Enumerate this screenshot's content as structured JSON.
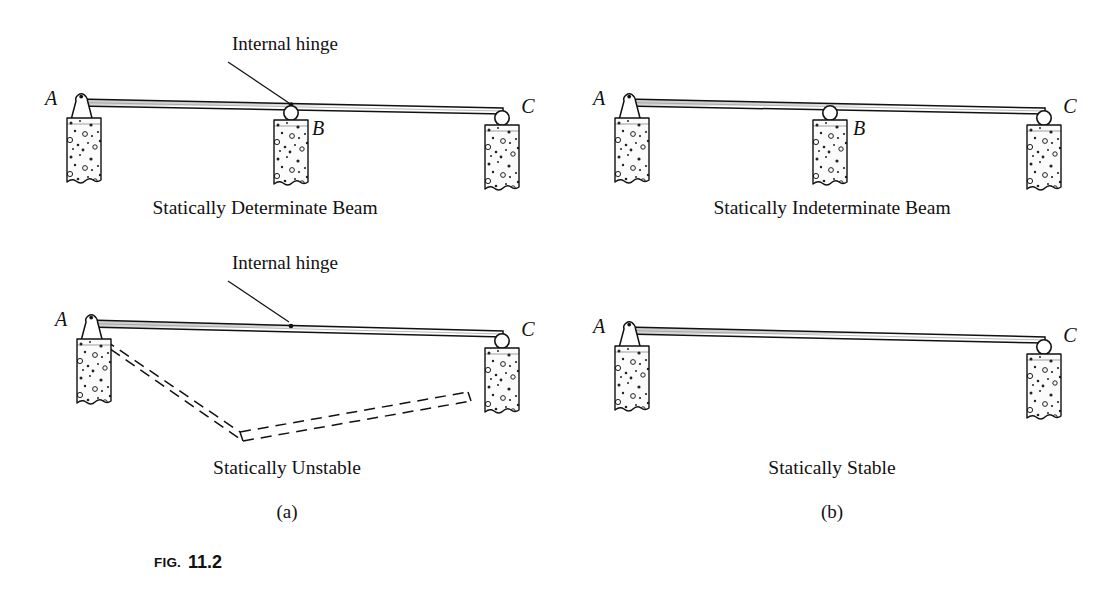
{
  "figure": {
    "number_prefix": "FIG.",
    "number_value": "11.2",
    "background_color": "#ffffff",
    "ink_color": "#111111",
    "beam_fill_color": "#d9d9d9",
    "block_fill_color": "#fbfbfb"
  },
  "annotations": {
    "internal_hinge": "Internal hinge"
  },
  "point_labels": {
    "a": "A",
    "b": "B",
    "c": "C"
  },
  "panels": [
    {
      "id": "statically-determinate",
      "caption": "Statically Determinate Beam",
      "column": "a",
      "row": "top",
      "has_internal_hinge": true,
      "hinge_label": "Internal hinge",
      "supports": [
        {
          "point": "A",
          "type": "pin"
        },
        {
          "point": "B",
          "type": "roller"
        },
        {
          "point": "C",
          "type": "roller"
        }
      ]
    },
    {
      "id": "statically-indeterminate",
      "caption": "Statically Indeterminate Beam",
      "column": "b",
      "row": "top",
      "has_internal_hinge": false,
      "hinge_label": "",
      "supports": [
        {
          "point": "A",
          "type": "pin"
        },
        {
          "point": "B",
          "type": "roller"
        },
        {
          "point": "C",
          "type": "roller"
        }
      ]
    },
    {
      "id": "statically-unstable",
      "caption": "Statically Unstable",
      "column": "a",
      "row": "bottom",
      "has_internal_hinge": true,
      "hinge_label": "Internal hinge",
      "has_collapse_mechanism": true,
      "supports": [
        {
          "point": "A",
          "type": "pin"
        },
        {
          "point": "C",
          "type": "roller"
        }
      ]
    },
    {
      "id": "statically-stable",
      "caption": "Statically Stable",
      "column": "b",
      "row": "bottom",
      "has_internal_hinge": false,
      "hinge_label": "",
      "has_collapse_mechanism": false,
      "supports": [
        {
          "point": "A",
          "type": "pin"
        },
        {
          "point": "C",
          "type": "roller"
        }
      ]
    }
  ],
  "subfigure_labels": {
    "left": "(a)",
    "right": "(b)"
  }
}
